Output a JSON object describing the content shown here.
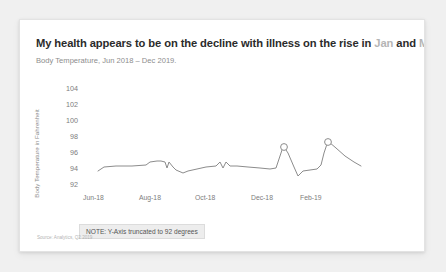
{
  "card": {
    "title_prefix": "My health appears to be on the decline with illness on the rise in ",
    "title_highlight_1": "Jan",
    "title_mid": " and ",
    "title_highlight_2": "Mar",
    "title_suffix": ".",
    "subtitle": "Body Temperature, Jun 2018 – Dec 2019.",
    "note": "NOTE: Y-Axis truncated to 92 degrees",
    "source": "Source: Analytics, Q2 2019",
    "highlight_color": "#b5b5b5",
    "line_color": "#8c8c8c",
    "marker_color": "#8c8c8c",
    "note_bg": "#ededed",
    "card_bg": "#ffffff",
    "page_bg": "#f0f0f0"
  },
  "chart_data": {
    "type": "line",
    "title": "My health appears to be on the decline with illness on the rise in Jan and Mar.",
    "subtitle": "Body Temperature, Jun 2018 – Dec 2019.",
    "xlabel": "",
    "ylabel": "Body Temperature in Fahrenheit",
    "ylim": [
      92,
      105
    ],
    "yticks": [
      92,
      94,
      96,
      98,
      100,
      102,
      104
    ],
    "xtick_labels": [
      "Jun-18",
      "Aug-18",
      "Oct-18",
      "Dec-18",
      "Feb-19"
    ],
    "grid": false,
    "legend": false,
    "annotation": "NOTE: Y-Axis truncated to 92 degrees",
    "categories": [
      "Jun-18",
      "Jul-18",
      "Aug-18",
      "Sep-18",
      "Oct-18",
      "Nov-18",
      "Dec-18",
      "Jan-19",
      "Feb-19",
      "Mar-19",
      "Apr-19",
      "May-19",
      "Jun-19",
      "Jul-19",
      "Aug-19",
      "Sep-19",
      "Oct-19",
      "Nov-19",
      "Dec-19"
    ],
    "values": [
      98.1,
      98.5,
      98.5,
      98.5,
      98.7,
      98.2,
      98.4,
      98.5,
      98.2,
      98.4,
      98.6,
      98.7,
      98.2,
      98.6,
      98.6,
      98.5,
      98.4,
      98.5,
      98.7
    ],
    "series": [
      {
        "name": "Body Temperature",
        "points": [
          {
            "x": "Jun-18",
            "y": 98.1
          },
          {
            "x": "Jul-18",
            "y": 98.5
          },
          {
            "x": "Aug-18",
            "y": 98.5
          },
          {
            "x": "Sep-18",
            "y": 98.6
          },
          {
            "x": "Oct-18",
            "y": 98.8
          },
          {
            "x": "Nov-18",
            "y": 98.2
          },
          {
            "x": "Dec-18",
            "y": 98.4
          },
          {
            "x": "Jan-19",
            "y": 98.1
          },
          {
            "x": "Feb-19",
            "y": 98.5
          },
          {
            "x": "Mar-19",
            "y": 98.6
          },
          {
            "x": "Apr-19",
            "y": 98.8
          },
          {
            "x": "May-19",
            "y": 98.2
          },
          {
            "x": "Jun-19",
            "y": 98.7
          },
          {
            "x": "Jul-19",
            "y": 98.6
          },
          {
            "x": "Aug-19",
            "y": 98.5
          },
          {
            "x": "Sep-19",
            "y": 98.4
          },
          {
            "x": "Oct-19",
            "y": 99.1
          },
          {
            "x": "Nov-19",
            "y": 100.3
          },
          {
            "x": "Dec-19",
            "y": 98.9
          }
        ]
      }
    ],
    "highlight_points": [
      {
        "label": "Jan",
        "value": 100.3
      },
      {
        "label": "Mar",
        "value": 100.9
      }
    ],
    "path_points": [
      [
        78,
        151
      ],
      [
        84,
        147
      ],
      [
        96,
        146
      ],
      [
        112,
        146
      ],
      [
        126,
        145
      ],
      [
        130,
        142
      ],
      [
        137,
        141
      ],
      [
        141,
        141
      ],
      [
        145,
        142
      ],
      [
        147,
        148
      ],
      [
        149,
        142
      ],
      [
        153,
        147
      ],
      [
        156,
        150
      ],
      [
        163,
        153
      ],
      [
        168,
        151
      ],
      [
        177,
        149
      ],
      [
        186,
        147
      ],
      [
        196,
        146
      ],
      [
        200,
        142
      ],
      [
        203,
        148
      ],
      [
        206,
        142
      ],
      [
        210,
        146
      ],
      [
        217,
        146
      ],
      [
        228,
        147
      ],
      [
        240,
        148
      ],
      [
        250,
        149
      ],
      [
        256,
        148
      ],
      [
        259,
        139
      ],
      [
        262,
        130
      ],
      [
        264,
        127
      ],
      [
        268,
        133
      ],
      [
        274,
        147
      ],
      [
        278,
        156
      ],
      [
        283,
        151
      ],
      [
        290,
        150
      ],
      [
        297,
        149
      ],
      [
        301,
        145
      ],
      [
        304,
        133
      ],
      [
        307,
        124
      ],
      [
        309,
        122
      ],
      [
        316,
        128
      ],
      [
        325,
        136
      ],
      [
        334,
        142
      ],
      [
        341,
        146
      ]
    ],
    "markers": [
      {
        "cx": 264,
        "cy": 127,
        "r": 3.4
      },
      {
        "cx": 308,
        "cy": 122,
        "r": 3.4
      }
    ],
    "ytick_layout": [
      {
        "value": "104",
        "top": 12
      },
      {
        "value": "102",
        "top": 28
      },
      {
        "value": "100",
        "top": 44
      },
      {
        "value": "98",
        "top": 60
      },
      {
        "value": "96",
        "top": 76
      },
      {
        "value": "94",
        "top": 92
      },
      {
        "value": "92",
        "top": 108
      }
    ],
    "xtick_layout": [
      {
        "label": "Jun-18",
        "left": 63
      },
      {
        "label": "Aug-18",
        "left": 119
      },
      {
        "label": "Oct-18",
        "left": 175
      },
      {
        "label": "Dec-18",
        "left": 231
      },
      {
        "label": "Feb-19",
        "left": 280
      }
    ]
  }
}
